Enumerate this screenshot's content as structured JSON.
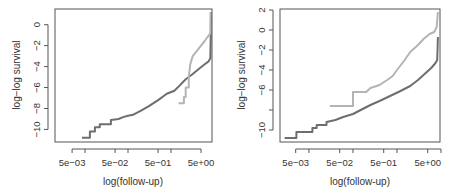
{
  "figure": {
    "width": 454,
    "height": 195
  },
  "colors": {
    "dark_series": "#6e6e6e",
    "light_series": "#b4b4b4",
    "axis": "#555555",
    "text": "#333333"
  },
  "chart_data": [
    {
      "type": "line",
      "step": true,
      "title": "",
      "xlabel": "log(follow-up)",
      "ylabel": "log−log survival",
      "xscale": "log",
      "xlim": [
        0.002,
        9
      ],
      "ylim": [
        -11.2,
        1.5
      ],
      "x_ticks_major": [
        0.005,
        0.05,
        0.5,
        5
      ],
      "x_tick_labels": [
        "5e−03",
        "5e−02",
        "5e−01",
        "5e+00"
      ],
      "x_ticks_minor": [
        0.01,
        0.1,
        1,
        10
      ],
      "y_ticks": [
        0,
        -2,
        -4,
        -6,
        -8,
        -10
      ],
      "y_tick_labels": [
        "0",
        "−2",
        "−4",
        "−6",
        "−8",
        "−10"
      ],
      "grid": false,
      "legend": null,
      "series": [
        {
          "name": "group 1 (dark)",
          "color": "#6e6e6e",
          "points": [
            [
              0.0085,
              -10.8
            ],
            [
              0.013,
              -10.8
            ],
            [
              0.013,
              -10.2
            ],
            [
              0.017,
              -10.2
            ],
            [
              0.017,
              -9.8
            ],
            [
              0.022,
              -9.8
            ],
            [
              0.022,
              -9.5
            ],
            [
              0.04,
              -9.5
            ],
            [
              0.04,
              -9.1
            ],
            [
              0.06,
              -9.0
            ],
            [
              0.08,
              -8.8
            ],
            [
              0.1,
              -8.7
            ],
            [
              0.13,
              -8.6
            ],
            [
              0.2,
              -8.2
            ],
            [
              0.3,
              -7.8
            ],
            [
              0.5,
              -7.2
            ],
            [
              0.8,
              -6.6
            ],
            [
              1.2,
              -6.3
            ],
            [
              1.6,
              -5.8
            ],
            [
              2.2,
              -5.2
            ],
            [
              3,
              -4.8
            ],
            [
              4.5,
              -4.2
            ],
            [
              6,
              -3.8
            ],
            [
              7.5,
              -3.5
            ],
            [
              8.2,
              -3.2
            ],
            [
              8.4,
              -1.2
            ],
            [
              8.5,
              1.2
            ]
          ]
        },
        {
          "name": "group 2 (light)",
          "color": "#b4b4b4",
          "points": [
            [
              1.5,
              -7.5
            ],
            [
              2.0,
              -7.5
            ],
            [
              2.0,
              -6.9
            ],
            [
              2.2,
              -6.9
            ],
            [
              2.2,
              -6.0
            ],
            [
              2.6,
              -6.0
            ],
            [
              2.6,
              -5.0
            ],
            [
              2.8,
              -3.8
            ],
            [
              3.2,
              -3.0
            ],
            [
              4,
              -2.5
            ],
            [
              5,
              -2.0
            ],
            [
              6,
              -1.6
            ],
            [
              7,
              -1.2
            ],
            [
              8,
              -0.9
            ],
            [
              8.3,
              -0.8
            ],
            [
              8.4,
              1.2
            ]
          ]
        }
      ]
    },
    {
      "type": "line",
      "step": true,
      "title": "",
      "xlabel": "log(follow-up)",
      "ylabel": "log−log survival",
      "xscale": "log",
      "xlim": [
        0.0022,
        9.5
      ],
      "ylim": [
        -11.2,
        2.1
      ],
      "x_ticks_major": [
        0.005,
        0.05,
        0.5,
        5
      ],
      "x_tick_labels": [
        "5e−03",
        "5e−02",
        "5e−01",
        "5e+00"
      ],
      "x_ticks_minor": [
        0.01,
        0.1,
        1,
        10
      ],
      "y_ticks": [
        2,
        0,
        -2,
        -4,
        -6,
        -8,
        -10
      ],
      "y_tick_labels": [
        "2",
        "0",
        "−2",
        "−4",
        "−6",
        "",
        "−10"
      ],
      "grid": false,
      "legend": null,
      "series": [
        {
          "name": "group 1 (dark)",
          "color": "#6e6e6e",
          "points": [
            [
              0.0028,
              -10.8
            ],
            [
              0.0052,
              -10.8
            ],
            [
              0.0052,
              -10.2
            ],
            [
              0.012,
              -10.2
            ],
            [
              0.012,
              -9.8
            ],
            [
              0.015,
              -9.8
            ],
            [
              0.015,
              -9.5
            ],
            [
              0.025,
              -9.5
            ],
            [
              0.025,
              -9.2
            ],
            [
              0.04,
              -9.0
            ],
            [
              0.06,
              -8.7
            ],
            [
              0.1,
              -8.4
            ],
            [
              0.15,
              -8.0
            ],
            [
              0.25,
              -7.5
            ],
            [
              0.4,
              -7.1
            ],
            [
              0.7,
              -6.6
            ],
            [
              1.2,
              -6.1
            ],
            [
              2,
              -5.6
            ],
            [
              3,
              -5.0
            ],
            [
              4.5,
              -4.3
            ],
            [
              6,
              -3.8
            ],
            [
              7.5,
              -3.3
            ],
            [
              8.2,
              -3.0
            ],
            [
              8.4,
              -1.8
            ],
            [
              8.5,
              -0.7
            ]
          ]
        },
        {
          "name": "group 2 (light)",
          "color": "#b4b4b4",
          "points": [
            [
              0.03,
              -7.6
            ],
            [
              0.1,
              -7.6
            ],
            [
              0.1,
              -6.2
            ],
            [
              0.2,
              -6.2
            ],
            [
              0.25,
              -5.8
            ],
            [
              0.4,
              -5.5
            ],
            [
              0.6,
              -5.0
            ],
            [
              0.8,
              -4.6
            ],
            [
              1.0,
              -4.0
            ],
            [
              1.5,
              -3.0
            ],
            [
              2,
              -2.2
            ],
            [
              3,
              -1.5
            ],
            [
              4,
              -0.9
            ],
            [
              5.5,
              -0.4
            ],
            [
              7,
              -0.2
            ],
            [
              8,
              0.3
            ],
            [
              8.5,
              1.8
            ]
          ]
        }
      ]
    }
  ]
}
